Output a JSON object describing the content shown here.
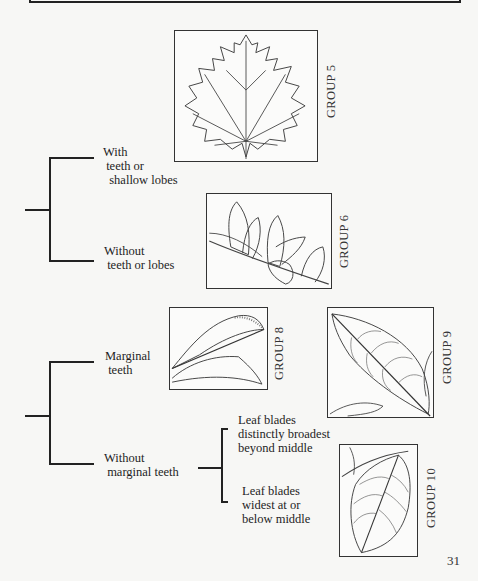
{
  "key": {
    "branch_a": {
      "option_1": "With\n teeth or\n  shallow lobes",
      "option_2": "Without\n teeth or lobes"
    },
    "branch_b": {
      "option_1": "Marginal\n teeth",
      "option_2": "Without\n marginal teeth",
      "sub_option_1": "Leaf blades\ndistinctly broadest\nbeyond middle",
      "sub_option_2": "Leaf blades\nwidest at or\nbelow middle"
    }
  },
  "groups": [
    {
      "label": "GROUP 5",
      "illustration": "lobed-toothed-maple-like-leaf"
    },
    {
      "label": "GROUP 6",
      "illustration": "smooth-leaves-on-twig"
    },
    {
      "label": "GROUP 8",
      "illustration": "toothed-lanceolate-leaves"
    },
    {
      "label": "GROUP 9",
      "illustration": "obovate-leaf"
    },
    {
      "label": "GROUP 10",
      "illustration": "ovate-leaf"
    }
  ],
  "page_number": "31"
}
